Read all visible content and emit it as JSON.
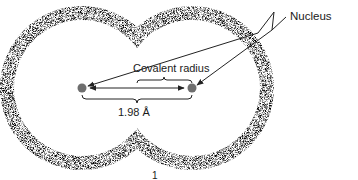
{
  "figure": {
    "labels": {
      "nucleus": "Nucleus",
      "covalent_radius": "Covalent radius",
      "bond_distance": "1.98 Å",
      "bottom_mark": "1"
    },
    "atoms": [
      {
        "name": "left-nucleus",
        "cx": 82,
        "cy": 88
      },
      {
        "name": "right-nucleus",
        "cx": 192,
        "cy": 88
      }
    ],
    "colors": {
      "stipple": "#555555",
      "nucleus": "#6e6e6e",
      "line": "#222222",
      "background": "#ffffff"
    }
  }
}
